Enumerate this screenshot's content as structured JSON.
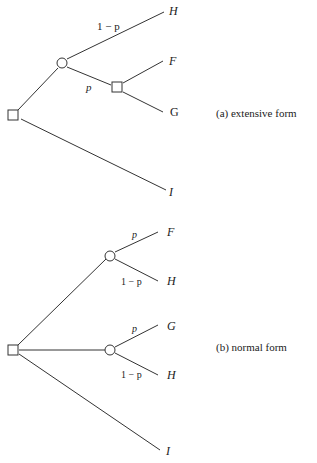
{
  "extensive": {
    "caption": "(a) extensive form",
    "edge_labels": {
      "up": "1 − p",
      "down": "p"
    },
    "leaves": {
      "H": "H",
      "F": "F",
      "G": "G",
      "I": "I"
    }
  },
  "normal": {
    "caption": "(b) normal form",
    "edge_labels": {
      "top_p": "p",
      "top_q": "1 − p",
      "mid_p": "p",
      "mid_q": "1 − p"
    },
    "leaves": {
      "F": "F",
      "H1": "H",
      "G": "G",
      "H2": "H",
      "I": "I"
    }
  }
}
